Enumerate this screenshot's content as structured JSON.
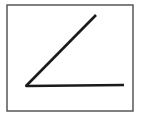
{
  "figure": {
    "background_color": "#ffffff",
    "frame": {
      "name": "border-rectangle",
      "x": 7,
      "y": 5,
      "width": 126,
      "height": 106,
      "stroke_color": "#4a4a4a",
      "stroke_width": 1.4,
      "fill": "#ffffff"
    },
    "shape": {
      "type": "angle",
      "stroke_color": "#1a1a1a",
      "stroke_width": 2.6,
      "vertex": {
        "x": 26,
        "y": 86
      },
      "rays": [
        {
          "name": "horizontal-ray",
          "from": {
            "x": 26,
            "y": 86
          },
          "to": {
            "x": 124,
            "y": 85
          }
        },
        {
          "name": "diagonal-ray",
          "from": {
            "x": 26,
            "y": 86
          },
          "to": {
            "x": 96,
            "y": 15
          }
        }
      ],
      "measure_degrees": 45
    }
  }
}
